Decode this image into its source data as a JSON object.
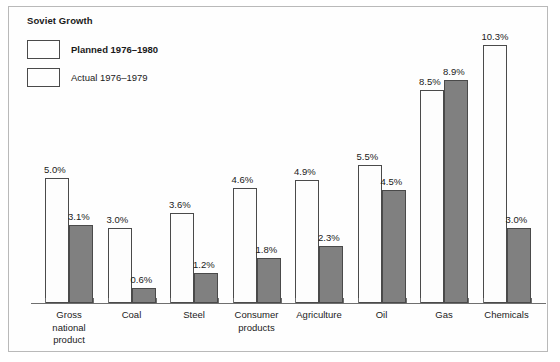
{
  "chart_data": {
    "type": "bar",
    "title": "Soviet Growth",
    "xlabel": "",
    "ylabel": "",
    "ylim": [
      0,
      11
    ],
    "grid": false,
    "legend_position": "top-left",
    "value_suffix": "%",
    "categories": [
      "Gross national product",
      "Coal",
      "Steel",
      "Consumer products",
      "Agriculture",
      "Oil",
      "Gas",
      "Chemicals"
    ],
    "series": [
      {
        "name": "Planned 1976–1980",
        "color": "#fdfdfd",
        "values": [
          5.0,
          3.0,
          3.6,
          4.6,
          4.9,
          5.5,
          8.5,
          10.3
        ],
        "labels": [
          "5.0%",
          "3.0%",
          "3.6%",
          "4.6%",
          "4.9%",
          "5.5%",
          "8.5%",
          "10.3%"
        ]
      },
      {
        "name": "Actual 1976–1979",
        "color": "#808080",
        "values": [
          3.1,
          0.6,
          1.2,
          1.8,
          2.3,
          4.5,
          8.9,
          3.0
        ],
        "labels": [
          "3.1%",
          "0.6%",
          "1.2%",
          "1.8%",
          "2.3%",
          "4.5%",
          "8.9%",
          "3.0%"
        ]
      }
    ],
    "category_label_lines": [
      [
        "Gross",
        "national",
        "product"
      ],
      [
        "Coal"
      ],
      [
        "Steel"
      ],
      [
        "Consumer",
        "products"
      ],
      [
        "Agriculture"
      ],
      [
        "Oil"
      ],
      [
        "Gas"
      ],
      [
        "Chemicals"
      ]
    ]
  }
}
